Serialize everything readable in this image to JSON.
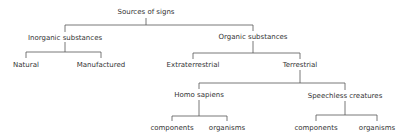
{
  "diagram": {
    "type": "tree",
    "line_color": "#555555",
    "text_color": "#333333",
    "root": {
      "label": "Sources of signs",
      "children": [
        {
          "label": "Inorganic substances",
          "children": [
            {
              "label": "Natural"
            },
            {
              "label": "Manufactured"
            }
          ]
        },
        {
          "label": "Organic substances",
          "children": [
            {
              "label": "Extraterrestrial"
            },
            {
              "label": "Terrestrial",
              "children": [
                {
                  "label": "Homo sapiens",
                  "children": [
                    {
                      "label": "components"
                    },
                    {
                      "label": "organisms"
                    }
                  ]
                },
                {
                  "label": "Speechless creatures",
                  "children": [
                    {
                      "label": "components"
                    },
                    {
                      "label": "organisms"
                    }
                  ]
                }
              ]
            }
          ]
        }
      ]
    }
  }
}
